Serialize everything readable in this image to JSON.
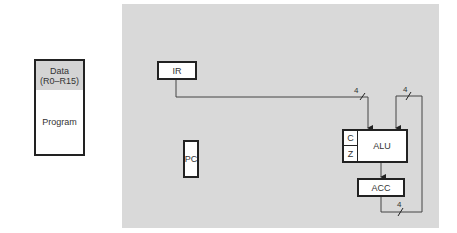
{
  "memory": {
    "data_label": "Data",
    "data_range": "(R0–R15)",
    "program_label": "Program"
  },
  "cpu": {
    "ir_label": "IR",
    "pc_label": "PC",
    "alu_label": "ALU",
    "flag_c": "C",
    "flag_z": "Z",
    "acc_label": "ACC"
  },
  "buses": {
    "ir_to_alu_width": "4",
    "feedback_to_alu_width": "4",
    "acc_out_width": "4"
  },
  "colors": {
    "panel": "#d9d9d9",
    "memory_data_bg": "#d4d4d4",
    "line": "#444444"
  }
}
